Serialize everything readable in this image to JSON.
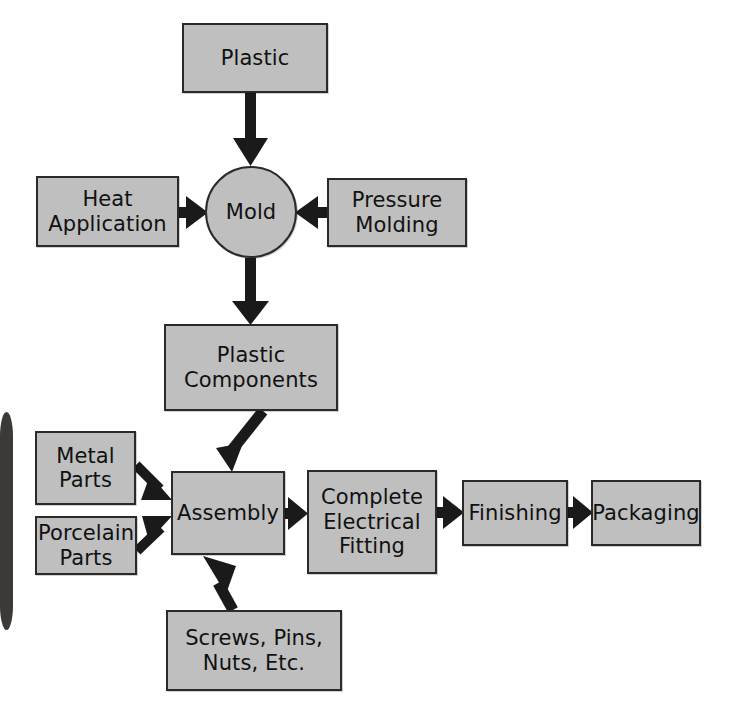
{
  "diagram": {
    "background_color": "#ffffff",
    "node_fill_color": "#bfbfbf",
    "node_border_color": "#2a2a2a",
    "arrow_color": "#1a1a1a",
    "nodes": [
      {
        "id": "plastic",
        "label": "Plastic",
        "shape": "rect",
        "x": 182,
        "y": 23,
        "w": 146,
        "h": 70,
        "font_size": 21
      },
      {
        "id": "heat_application",
        "label": "Heat\nApplication",
        "shape": "rect",
        "x": 36,
        "y": 176,
        "w": 143,
        "h": 71,
        "font_size": 21
      },
      {
        "id": "mold",
        "label": "Mold",
        "shape": "circle",
        "x": 205,
        "y": 166,
        "w": 92,
        "h": 92,
        "font_size": 21
      },
      {
        "id": "pressure_molding",
        "label": "Pressure\nMolding",
        "shape": "rect",
        "x": 327,
        "y": 178,
        "w": 140,
        "h": 69,
        "font_size": 21
      },
      {
        "id": "plastic_components",
        "label": "Plastic\nComponents",
        "shape": "rect",
        "x": 164,
        "y": 324,
        "w": 174,
        "h": 87,
        "font_size": 21
      },
      {
        "id": "metal_parts",
        "label": "Metal\nParts",
        "shape": "rect",
        "x": 35,
        "y": 431,
        "w": 101,
        "h": 74,
        "font_size": 21
      },
      {
        "id": "porcelain_parts",
        "label": "Porcelain\nParts",
        "shape": "rect",
        "x": 35,
        "y": 516,
        "w": 102,
        "h": 59,
        "font_size": 21
      },
      {
        "id": "assembly",
        "label": "Assembly",
        "shape": "rect",
        "x": 171,
        "y": 471,
        "w": 114,
        "h": 84,
        "font_size": 21
      },
      {
        "id": "complete_fitting",
        "label": "Complete\nElectrical\nFitting",
        "shape": "rect",
        "x": 307,
        "y": 470,
        "w": 130,
        "h": 104,
        "font_size": 21
      },
      {
        "id": "finishing",
        "label": "Finishing",
        "shape": "rect",
        "x": 462,
        "y": 480,
        "w": 106,
        "h": 66,
        "font_size": 21
      },
      {
        "id": "packaging",
        "label": "Packaging",
        "shape": "rect",
        "x": 591,
        "y": 480,
        "w": 110,
        "h": 66,
        "font_size": 21
      },
      {
        "id": "screws_pins",
        "label": "Screws, Pins,\nNuts, Etc.",
        "shape": "rect",
        "x": 166,
        "y": 610,
        "w": 176,
        "h": 81,
        "font_size": 21
      }
    ],
    "edges": [
      {
        "from": "plastic",
        "to": "mold",
        "direction": "down"
      },
      {
        "from": "heat_application",
        "to": "mold",
        "direction": "right"
      },
      {
        "from": "pressure_molding",
        "to": "mold",
        "direction": "left"
      },
      {
        "from": "mold",
        "to": "plastic_components",
        "direction": "down"
      },
      {
        "from": "plastic_components",
        "to": "assembly",
        "direction": "down-left"
      },
      {
        "from": "metal_parts",
        "to": "assembly",
        "direction": "down-right"
      },
      {
        "from": "porcelain_parts",
        "to": "assembly",
        "direction": "up-right"
      },
      {
        "from": "screws_pins",
        "to": "assembly",
        "direction": "up"
      },
      {
        "from": "assembly",
        "to": "complete_fitting",
        "direction": "right"
      },
      {
        "from": "complete_fitting",
        "to": "finishing",
        "direction": "right"
      },
      {
        "from": "finishing",
        "to": "packaging",
        "direction": "right"
      }
    ],
    "artifacts": [
      {
        "id": "scan-edge-bar",
        "x": 0,
        "y": 412,
        "w": 13,
        "h": 218,
        "color": "#3b3a38"
      }
    ]
  }
}
